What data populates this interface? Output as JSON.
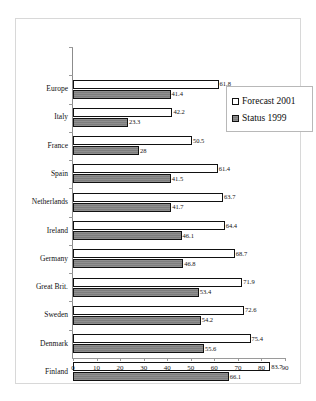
{
  "chart_data": {
    "type": "bar",
    "orientation": "horizontal",
    "title": "",
    "subtitle": "",
    "xlabel": "",
    "ylabel": "",
    "xlim": [
      0,
      90
    ],
    "xticks": [
      0,
      10,
      20,
      30,
      40,
      50,
      60,
      70,
      80,
      90
    ],
    "grid": false,
    "legend_position": "top-right",
    "categories": [
      "Europe",
      "Italy",
      "France",
      "Spain",
      "Netherlands",
      "Ireland",
      "Germany",
      "Great Brit.",
      "Sweden",
      "Denmark",
      "Finland"
    ],
    "series": [
      {
        "name": "Forecast 2001",
        "color": "#ffffff",
        "values": [
          61.8,
          42.2,
          50.5,
          61.4,
          63.7,
          64.4,
          68.7,
          71.9,
          72.6,
          75.4,
          83.7
        ],
        "labels": [
          "61.8",
          "42.2",
          "50.5",
          "61.4",
          "63.7",
          "64.4",
          "68.7",
          "71.9",
          "72.6",
          "75.4",
          "83.7"
        ]
      },
      {
        "name": "Status 1999",
        "color": "#808080",
        "values": [
          41.4,
          23.3,
          28,
          41.5,
          41.7,
          46.1,
          46.8,
          53.4,
          54.2,
          55.6,
          66.1
        ],
        "labels": [
          "41.4",
          "23.3",
          "28",
          "41.5",
          "41.7",
          "46.1",
          "46.8",
          "53.4",
          "54.2",
          "55.6",
          "66.1"
        ]
      }
    ]
  },
  "legend": {
    "items": [
      {
        "label": "Forecast 2001",
        "swatch": "forecast"
      },
      {
        "label": "Status 1999",
        "swatch": "status"
      }
    ]
  }
}
